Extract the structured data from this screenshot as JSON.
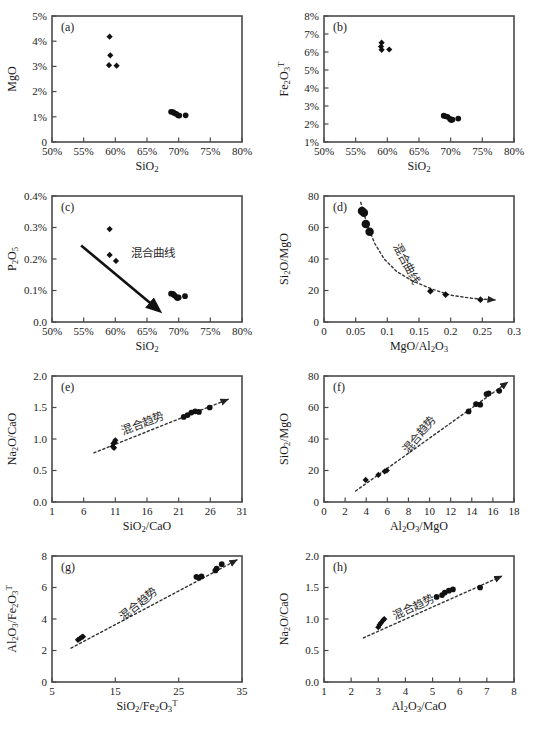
{
  "figure": {
    "panels": [
      "a",
      "b",
      "c",
      "d",
      "e",
      "f",
      "g",
      "h"
    ],
    "annotation_mixing_curve": "混合曲线",
    "annotation_mixing_trend": "混合趋势"
  },
  "chart_data": [
    {
      "type": "scatter",
      "panel": "a",
      "title": "",
      "xlabel": "SiO2",
      "ylabel": "MgO",
      "xlim": [
        50,
        80
      ],
      "ylim": [
        0,
        5
      ],
      "xticks": [
        50,
        55,
        60,
        65,
        70,
        75,
        80
      ],
      "xticklabels": [
        "50%",
        "55%",
        "60%",
        "65%",
        "70%",
        "75%",
        "80%"
      ],
      "yticks": [
        0,
        1,
        2,
        3,
        4,
        5
      ],
      "yticklabels": [
        "0",
        "1%",
        "2%",
        "3%",
        "4%",
        "5%"
      ],
      "grid": false,
      "legend": "none",
      "series": [
        {
          "name": "mafic group",
          "marker": "diamond",
          "points": [
            [
              59.1,
              4.18
            ],
            [
              59.2,
              3.44
            ],
            [
              59.0,
              3.05
            ],
            [
              60.2,
              3.03
            ]
          ]
        },
        {
          "name": "felsic group",
          "marker": "circle",
          "points": [
            [
              68.8,
              1.2
            ],
            [
              69.1,
              1.19
            ],
            [
              69.3,
              1.15
            ],
            [
              69.6,
              1.12
            ],
            [
              69.9,
              1.06
            ],
            [
              70.1,
              1.05
            ],
            [
              71.1,
              1.06
            ]
          ]
        }
      ]
    },
    {
      "type": "scatter",
      "panel": "b",
      "title": "",
      "xlabel": "SiO2",
      "ylabel": "Fe2O3T",
      "xlim": [
        50,
        80
      ],
      "ylim": [
        1,
        8
      ],
      "xticks": [
        50,
        55,
        60,
        65,
        70,
        75,
        80
      ],
      "xticklabels": [
        "50%",
        "55%",
        "60%",
        "65%",
        "70%",
        "75%",
        "80%"
      ],
      "yticks": [
        1,
        2,
        3,
        4,
        5,
        6,
        7,
        8
      ],
      "yticklabels": [
        "1%",
        "2%",
        "3%",
        "4%",
        "5%",
        "6%",
        "7%",
        "8%"
      ],
      "grid": false,
      "legend": "none",
      "series": [
        {
          "name": "mafic group",
          "marker": "diamond",
          "points": [
            [
              59.1,
              6.52
            ],
            [
              59.0,
              6.3
            ],
            [
              59.1,
              6.12
            ],
            [
              60.3,
              6.14
            ]
          ]
        },
        {
          "name": "felsic group",
          "marker": "circle",
          "points": [
            [
              68.9,
              2.46
            ],
            [
              69.2,
              2.43
            ],
            [
              69.5,
              2.4
            ],
            [
              69.9,
              2.28
            ],
            [
              70.1,
              2.22
            ],
            [
              70.3,
              2.25
            ],
            [
              71.2,
              2.3
            ]
          ]
        }
      ]
    },
    {
      "type": "scatter",
      "panel": "c",
      "title": "",
      "xlabel": "SiO2",
      "ylabel": "P2O5",
      "xlim": [
        50,
        80
      ],
      "ylim": [
        0,
        0.4
      ],
      "xticks": [
        50,
        55,
        60,
        65,
        70,
        75,
        80
      ],
      "xticklabels": [
        "50%",
        "55%",
        "60%",
        "65%",
        "70%",
        "75%",
        "80%"
      ],
      "yticks": [
        0,
        0.1,
        0.2,
        0.3,
        0.4
      ],
      "yticklabels": [
        "0.0",
        "0.1%",
        "0.2%",
        "0.3%",
        "0.4%"
      ],
      "grid": false,
      "legend": "none",
      "annotation": "混合曲线",
      "arrow": {
        "style": "solid",
        "from": [
          54.6,
          0.243
        ],
        "to": [
          66.4,
          0.045
        ]
      },
      "series": [
        {
          "name": "mafic group",
          "marker": "diamond",
          "points": [
            [
              59.1,
              0.295
            ],
            [
              59.1,
              0.213
            ],
            [
              60.1,
              0.194
            ]
          ]
        },
        {
          "name": "felsic group",
          "marker": "circle",
          "points": [
            [
              68.8,
              0.09
            ],
            [
              69.1,
              0.089
            ],
            [
              69.3,
              0.085
            ],
            [
              69.6,
              0.08
            ],
            [
              69.8,
              0.076
            ],
            [
              70.0,
              0.078
            ],
            [
              71.0,
              0.082
            ]
          ]
        }
      ]
    },
    {
      "type": "scatter",
      "panel": "d",
      "title": "",
      "xlabel": "MgO/Al2O3",
      "ylabel": "Si2O/MgO",
      "xlim": [
        0,
        0.3
      ],
      "ylim": [
        0,
        80
      ],
      "xticks": [
        0,
        0.05,
        0.1,
        0.15,
        0.2,
        0.25,
        0.3
      ],
      "xticklabels": [
        "0",
        "0.05",
        "0.1",
        "0.15",
        "0.2",
        "0.25",
        "0.3"
      ],
      "yticks": [
        0,
        20,
        40,
        60,
        80
      ],
      "yticklabels": [
        "0",
        "20",
        "40",
        "60",
        "80"
      ],
      "grid": false,
      "legend": "none",
      "annotation": "混合曲线",
      "curve": {
        "style": "dashed",
        "arrow_end": true,
        "points": [
          [
            0.058,
            76
          ],
          [
            0.068,
            62
          ],
          [
            0.08,
            50
          ],
          [
            0.095,
            40
          ],
          [
            0.115,
            32
          ],
          [
            0.14,
            26
          ],
          [
            0.17,
            21
          ],
          [
            0.2,
            17
          ],
          [
            0.235,
            15
          ],
          [
            0.27,
            14
          ]
        ]
      },
      "series": [
        {
          "name": "felsic group",
          "marker": "circle",
          "points": [
            [
              0.06,
              70.5
            ],
            [
              0.063,
              69.4
            ],
            [
              0.066,
              62.2
            ],
            [
              0.072,
              57.3
            ]
          ]
        },
        {
          "name": "mafic group",
          "marker": "diamond",
          "points": [
            [
              0.168,
              19.6
            ],
            [
              0.192,
              17.4
            ],
            [
              0.247,
              14.2
            ]
          ]
        }
      ]
    },
    {
      "type": "scatter",
      "panel": "e",
      "title": "",
      "xlabel": "SiO2/CaO",
      "ylabel": "Na2O/CaO",
      "xlim": [
        1,
        31
      ],
      "ylim": [
        0,
        2.0
      ],
      "xticks": [
        1,
        6,
        11,
        16,
        21,
        26,
        31
      ],
      "xticklabels": [
        "1",
        "6",
        "11",
        "16",
        "21",
        "26",
        "31"
      ],
      "yticks": [
        0,
        0.5,
        1.0,
        1.5,
        2.0
      ],
      "yticklabels": [
        "0.0",
        "0.5",
        "1.0",
        "1.5",
        "2.0"
      ],
      "grid": false,
      "legend": "none",
      "annotation": "混合趋势",
      "trendline": {
        "style": "dashed",
        "arrow_end": true,
        "from": [
          7.6,
          0.78
        ],
        "to": [
          28.8,
          1.63
        ]
      },
      "series": [
        {
          "name": "mafic group",
          "marker": "diamond",
          "points": [
            [
              10.6,
              0.88
            ],
            [
              10.7,
              0.93
            ],
            [
              10.8,
              0.86
            ],
            [
              10.9,
              0.95
            ],
            [
              11.0,
              0.98
            ]
          ]
        },
        {
          "name": "felsic group",
          "marker": "circle",
          "points": [
            [
              21.8,
              1.35
            ],
            [
              22.4,
              1.38
            ],
            [
              23.0,
              1.42
            ],
            [
              23.6,
              1.44
            ],
            [
              24.2,
              1.43
            ],
            [
              25.9,
              1.5
            ]
          ]
        }
      ]
    },
    {
      "type": "scatter",
      "panel": "f",
      "title": "",
      "xlabel": "Al2O3/MgO",
      "ylabel": "SiO2/MgO",
      "xlim": [
        0,
        18
      ],
      "ylim": [
        0,
        80
      ],
      "xticks": [
        0,
        2,
        4,
        6,
        8,
        10,
        12,
        14,
        16,
        18
      ],
      "xticklabels": [
        "0",
        "2",
        "4",
        "6",
        "8",
        "10",
        "12",
        "14",
        "16",
        "18"
      ],
      "yticks": [
        0,
        20,
        40,
        60,
        80
      ],
      "yticklabels": [
        "0",
        "20",
        "40",
        "60",
        "80"
      ],
      "grid": false,
      "legend": "none",
      "annotation": "混合趋势",
      "trendline": {
        "style": "dashed",
        "arrow_end": true,
        "from": [
          3.0,
          7.0
        ],
        "to": [
          17.4,
          76.0
        ]
      },
      "series": [
        {
          "name": "mafic group",
          "marker": "diamond",
          "points": [
            [
              3.95,
              14.0
            ],
            [
              5.15,
              17.2
            ],
            [
              5.75,
              19.4
            ],
            [
              5.95,
              20.0
            ]
          ]
        },
        {
          "name": "felsic group",
          "marker": "circle",
          "points": [
            [
              13.7,
              57.5
            ],
            [
              14.4,
              62.2
            ],
            [
              14.8,
              61.8
            ],
            [
              15.4,
              68.5
            ],
            [
              15.6,
              69.0
            ],
            [
              16.6,
              70.6
            ]
          ]
        }
      ]
    },
    {
      "type": "scatter",
      "panel": "g",
      "title": "",
      "xlabel": "SiO2/Fe2O3T",
      "ylabel": "Al2O3/Fe2O3T",
      "xlim": [
        5,
        35
      ],
      "ylim": [
        0,
        8
      ],
      "xticks": [
        5,
        15,
        25,
        35
      ],
      "xticklabels": [
        "5",
        "15",
        "25",
        "35"
      ],
      "yticks": [
        0,
        2,
        4,
        6,
        8
      ],
      "yticklabels": [
        "0",
        "2",
        "4",
        "6",
        "8"
      ],
      "grid": false,
      "legend": "none",
      "annotation": "混合趋势",
      "trendline": {
        "style": "dashed",
        "arrow_end": true,
        "from": [
          8.0,
          2.15
        ],
        "to": [
          34.2,
          7.75
        ]
      },
      "series": [
        {
          "name": "mafic group",
          "marker": "diamond",
          "points": [
            [
              9.1,
              2.68
            ],
            [
              9.4,
              2.75
            ],
            [
              9.7,
              2.85
            ],
            [
              9.9,
              2.88
            ]
          ]
        },
        {
          "name": "felsic group",
          "marker": "circle",
          "points": [
            [
              27.8,
              6.68
            ],
            [
              28.2,
              6.62
            ],
            [
              28.6,
              6.7
            ],
            [
              30.8,
              7.08
            ],
            [
              31.0,
              7.2
            ],
            [
              31.8,
              7.48
            ]
          ]
        }
      ]
    },
    {
      "type": "scatter",
      "panel": "h",
      "title": "",
      "xlabel": "Al2O3/CaO",
      "ylabel": "Na2O/CaO",
      "xlim": [
        1,
        8
      ],
      "ylim": [
        0,
        2.0
      ],
      "xticks": [
        1,
        2,
        3,
        4,
        5,
        6,
        7,
        8
      ],
      "xticklabels": [
        "1",
        "2",
        "3",
        "4",
        "5",
        "6",
        "7",
        "8"
      ],
      "yticks": [
        0,
        0.5,
        1.0,
        1.5,
        2.0
      ],
      "yticklabels": [
        "0.0",
        "0.5",
        "1.0",
        "1.5",
        "2.0"
      ],
      "grid": false,
      "legend": "none",
      "annotation": "混合趋势",
      "trendline": {
        "style": "dashed",
        "arrow_end": true,
        "from": [
          2.45,
          0.7
        ],
        "to": [
          7.55,
          1.68
        ]
      },
      "series": [
        {
          "name": "mafic group",
          "marker": "diamond",
          "points": [
            [
              3.0,
              0.87
            ],
            [
              3.05,
              0.91
            ],
            [
              3.1,
              0.94
            ],
            [
              3.18,
              0.98
            ],
            [
              3.22,
              1.0
            ]
          ]
        },
        {
          "name": "felsic group",
          "marker": "circle",
          "points": [
            [
              5.15,
              1.35
            ],
            [
              5.35,
              1.38
            ],
            [
              5.45,
              1.42
            ],
            [
              5.6,
              1.45
            ],
            [
              5.75,
              1.47
            ],
            [
              6.75,
              1.5
            ]
          ]
        }
      ]
    }
  ]
}
